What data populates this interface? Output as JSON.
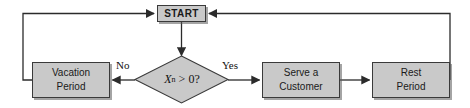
{
  "diagram": {
    "type": "flowchart",
    "canvas": {
      "width": 470,
      "height": 108,
      "background": "#ffffff"
    },
    "style": {
      "node_fill": "#c9c9c9",
      "node_border": "#3a3a3a",
      "edge_color": "#2b2b2b",
      "text_color": "#1a1a1a"
    },
    "nodes": {
      "start": {
        "label": "START",
        "shape": "rectangle"
      },
      "decision": {
        "variable": "X",
        "subscript": "n",
        "operator": ">",
        "value": "0?",
        "shape": "diamond"
      },
      "vacation": {
        "line1": "Vacation",
        "line2": "Period",
        "shape": "rectangle"
      },
      "serve": {
        "line1": "Serve a",
        "line2": "Customer",
        "shape": "rectangle"
      },
      "rest": {
        "line1": "Rest",
        "line2": "Period",
        "shape": "rectangle"
      }
    },
    "edge_labels": {
      "no": "No",
      "yes": "Yes"
    }
  }
}
